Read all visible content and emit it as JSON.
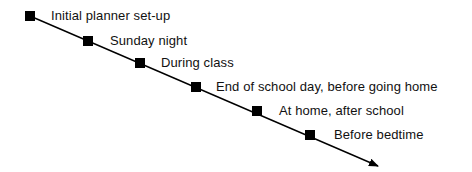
{
  "diagram": {
    "type": "timeline",
    "line_color": "#000000",
    "marker_color": "#000000",
    "steps": [
      {
        "label": "Initial planner set-up"
      },
      {
        "label": "Sunday night"
      },
      {
        "label": "During class"
      },
      {
        "label": "End of school day, before going home"
      },
      {
        "label": "At home, after school"
      },
      {
        "label": "Before bedtime"
      }
    ]
  }
}
